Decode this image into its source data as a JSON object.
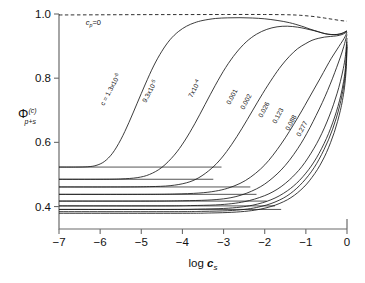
{
  "figure": {
    "background": "#ffffff",
    "axis_color": "#6b6b6b",
    "curve_color": "#1a1a1a"
  },
  "chart_data": {
    "type": "line",
    "title": "",
    "subtitle": "",
    "xlabel": "log c_s",
    "xlabel_parts": {
      "main": "log ",
      "var": "c",
      "sub": "s"
    },
    "ylabel": "Φ(c)p+s",
    "ylabel_parts": {
      "symbol": "Φ",
      "sup": "(c)",
      "sub": "p+s"
    },
    "xlim": [
      -7,
      0
    ],
    "ylim": [
      0.33,
      1.0
    ],
    "xticks": [
      -7,
      -6,
      -5,
      -4,
      -3,
      -2,
      -1,
      0
    ],
    "xticklabels": [
      "−7",
      "−6",
      "−5",
      "−4",
      "−3",
      "−2",
      "−1",
      "0"
    ],
    "yticks": [
      0.4,
      0.6,
      0.8,
      1.0
    ],
    "yticklabels": [
      "0.4",
      "0.6",
      "0.8",
      "1.0"
    ],
    "grid": false,
    "legend_position": "inline-curve-labels",
    "annotations": [
      {
        "name": "cp-zero",
        "text_parts": {
          "var": "c",
          "sub": "p",
          "rest": "=0"
        },
        "text": "c_p=0",
        "x": -6.35,
        "y": 0.965,
        "style": "upright"
      }
    ],
    "series": [
      {
        "name": "cp-zero-dashed",
        "label": "c_p=0",
        "style": "dashed",
        "points": [
          [
            -7,
            0.997
          ],
          [
            -6,
            0.9975
          ],
          [
            -5,
            0.998
          ],
          [
            -4,
            0.9982
          ],
          [
            -3,
            0.9984
          ],
          [
            -2.5,
            0.9985
          ],
          [
            -2,
            0.9984
          ],
          [
            -1.5,
            0.9978
          ],
          [
            -1.2,
            0.9965
          ],
          [
            -1.0,
            0.9945
          ],
          [
            -0.8,
            0.992
          ],
          [
            -0.6,
            0.9885
          ],
          [
            -0.45,
            0.9855
          ],
          [
            -0.3,
            0.9825
          ],
          [
            -0.15,
            0.9795
          ],
          [
            0,
            0.9775
          ]
        ]
      },
      {
        "name": "curve-1",
        "label": "cₛ = 1.3x10⁻⁶",
        "label_text": "c = 1.3x10",
        "label_exp": "-6",
        "label_rot": -62,
        "label_x": 104,
        "label_y": 106,
        "plateau": 0.523,
        "style": "solid",
        "points": [
          [
            -7,
            0.523
          ],
          [
            -6.6,
            0.523
          ],
          [
            -6.3,
            0.524
          ],
          [
            -6.1,
            0.528
          ],
          [
            -5.9,
            0.54
          ],
          [
            -5.7,
            0.566
          ],
          [
            -5.5,
            0.608
          ],
          [
            -5.3,
            0.662
          ],
          [
            -5.1,
            0.722
          ],
          [
            -4.9,
            0.782
          ],
          [
            -4.7,
            0.838
          ],
          [
            -4.5,
            0.884
          ],
          [
            -4.3,
            0.92
          ],
          [
            -4.1,
            0.945
          ],
          [
            -3.9,
            0.962
          ],
          [
            -3.7,
            0.973
          ],
          [
            -3.5,
            0.98
          ],
          [
            -3.2,
            0.986
          ],
          [
            -2.9,
            0.988
          ],
          [
            -2.6,
            0.9885
          ],
          [
            -2.3,
            0.9875
          ],
          [
            -2.0,
            0.985
          ],
          [
            -1.7,
            0.98
          ],
          [
            -1.4,
            0.973
          ],
          [
            -1.1,
            0.962
          ],
          [
            -0.9,
            0.953
          ],
          [
            -0.7,
            0.945
          ],
          [
            -0.55,
            0.939
          ],
          [
            -0.4,
            0.936
          ],
          [
            -0.25,
            0.936
          ],
          [
            -0.12,
            0.94
          ],
          [
            0,
            0.948
          ]
        ]
      },
      {
        "name": "curve-2",
        "label": "9.3x10⁻⁵",
        "label_text": "9.3x10",
        "label_exp": "-5",
        "label_rot": -62,
        "label_x": 146,
        "label_y": 103,
        "plateau": 0.485,
        "style": "solid",
        "points": [
          [
            -7,
            0.485
          ],
          [
            -6.0,
            0.485
          ],
          [
            -5.5,
            0.486
          ],
          [
            -5.1,
            0.49
          ],
          [
            -4.8,
            0.5
          ],
          [
            -4.5,
            0.522
          ],
          [
            -4.2,
            0.56
          ],
          [
            -3.95,
            0.604
          ],
          [
            -3.7,
            0.658
          ],
          [
            -3.45,
            0.718
          ],
          [
            -3.2,
            0.778
          ],
          [
            -2.95,
            0.833
          ],
          [
            -2.7,
            0.878
          ],
          [
            -2.45,
            0.913
          ],
          [
            -2.2,
            0.937
          ],
          [
            -1.95,
            0.952
          ],
          [
            -1.7,
            0.96
          ],
          [
            -1.45,
            0.962
          ],
          [
            -1.2,
            0.959
          ],
          [
            -1.0,
            0.954
          ],
          [
            -0.8,
            0.948
          ],
          [
            -0.6,
            0.941
          ],
          [
            -0.45,
            0.937
          ],
          [
            -0.3,
            0.936
          ],
          [
            -0.15,
            0.938
          ],
          [
            0,
            0.946
          ]
        ]
      },
      {
        "name": "curve-3",
        "label": "7x10⁻⁴",
        "label_text": "7x10",
        "label_exp": "-4",
        "label_rot": -62,
        "label_x": 192,
        "label_y": 98,
        "plateau": 0.461,
        "style": "solid",
        "points": [
          [
            -7,
            0.461
          ],
          [
            -5.5,
            0.461
          ],
          [
            -4.8,
            0.462
          ],
          [
            -4.3,
            0.465
          ],
          [
            -3.9,
            0.474
          ],
          [
            -3.6,
            0.49
          ],
          [
            -3.3,
            0.518
          ],
          [
            -3.05,
            0.551
          ],
          [
            -2.8,
            0.594
          ],
          [
            -2.55,
            0.644
          ],
          [
            -2.3,
            0.698
          ],
          [
            -2.05,
            0.752
          ],
          [
            -1.8,
            0.802
          ],
          [
            -1.6,
            0.838
          ],
          [
            -1.4,
            0.868
          ],
          [
            -1.2,
            0.892
          ],
          [
            -1.0,
            0.908
          ],
          [
            -0.85,
            0.918
          ],
          [
            -0.7,
            0.924
          ],
          [
            -0.55,
            0.928
          ],
          [
            -0.4,
            0.93
          ],
          [
            -0.25,
            0.932
          ],
          [
            -0.12,
            0.936
          ],
          [
            0,
            0.944
          ]
        ]
      },
      {
        "name": "curve-4",
        "label": "0.001",
        "label_rot": -62,
        "label_x": 230,
        "label_y": 105,
        "plateau": 0.438,
        "style": "solid",
        "points": [
          [
            -7,
            0.438
          ],
          [
            -5.0,
            0.438
          ],
          [
            -4.2,
            0.439
          ],
          [
            -3.6,
            0.442
          ],
          [
            -3.2,
            0.448
          ],
          [
            -2.9,
            0.457
          ],
          [
            -2.6,
            0.472
          ],
          [
            -2.35,
            0.491
          ],
          [
            -2.1,
            0.517
          ],
          [
            -1.9,
            0.544
          ],
          [
            -1.7,
            0.577
          ],
          [
            -1.5,
            0.614
          ],
          [
            -1.3,
            0.655
          ],
          [
            -1.1,
            0.698
          ],
          [
            -0.95,
            0.732
          ],
          [
            -0.8,
            0.766
          ],
          [
            -0.65,
            0.8
          ],
          [
            -0.5,
            0.835
          ],
          [
            -0.38,
            0.862
          ],
          [
            -0.25,
            0.888
          ],
          [
            -0.15,
            0.908
          ],
          [
            -0.07,
            0.924
          ],
          [
            0,
            0.942
          ]
        ]
      },
      {
        "name": "curve-5",
        "label": "0.002",
        "label_rot": -62,
        "label_x": 244,
        "label_y": 110,
        "plateau": 0.417,
        "style": "solid",
        "points": [
          [
            -7,
            0.417
          ],
          [
            -4.8,
            0.417
          ],
          [
            -4.0,
            0.418
          ],
          [
            -3.4,
            0.42
          ],
          [
            -3.0,
            0.424
          ],
          [
            -2.7,
            0.431
          ],
          [
            -2.45,
            0.441
          ],
          [
            -2.2,
            0.455
          ],
          [
            -2.0,
            0.47
          ],
          [
            -1.8,
            0.49
          ],
          [
            -1.6,
            0.514
          ],
          [
            -1.4,
            0.544
          ],
          [
            -1.2,
            0.58
          ],
          [
            -1.05,
            0.611
          ],
          [
            -0.9,
            0.646
          ],
          [
            -0.75,
            0.684
          ],
          [
            -0.6,
            0.724
          ],
          [
            -0.47,
            0.762
          ],
          [
            -0.35,
            0.8
          ],
          [
            -0.25,
            0.834
          ],
          [
            -0.16,
            0.866
          ],
          [
            -0.08,
            0.898
          ],
          [
            0,
            0.936
          ]
        ]
      },
      {
        "name": "curve-6",
        "label": "0.026",
        "label_rot": -62,
        "label_x": 262,
        "label_y": 118,
        "plateau": 0.402,
        "style": "solid",
        "points": [
          [
            -7,
            0.402
          ],
          [
            -4.5,
            0.402
          ],
          [
            -3.8,
            0.403
          ],
          [
            -3.2,
            0.405
          ],
          [
            -2.8,
            0.409
          ],
          [
            -2.5,
            0.415
          ],
          [
            -2.25,
            0.423
          ],
          [
            -2.0,
            0.434
          ],
          [
            -1.8,
            0.446
          ],
          [
            -1.6,
            0.462
          ],
          [
            -1.4,
            0.483
          ],
          [
            -1.25,
            0.502
          ],
          [
            -1.1,
            0.524
          ],
          [
            -0.95,
            0.551
          ],
          [
            -0.8,
            0.582
          ],
          [
            -0.68,
            0.61
          ],
          [
            -0.55,
            0.645
          ],
          [
            -0.43,
            0.682
          ],
          [
            -0.33,
            0.717
          ],
          [
            -0.24,
            0.753
          ],
          [
            -0.16,
            0.79
          ],
          [
            -0.09,
            0.83
          ],
          [
            -0.04,
            0.868
          ],
          [
            0,
            0.925
          ]
        ]
      },
      {
        "name": "curve-7",
        "label": "0.123",
        "label_rot": -62,
        "label_x": 276,
        "label_y": 124,
        "plateau": 0.391,
        "style": "solid",
        "points": [
          [
            -7,
            0.391
          ],
          [
            -4.3,
            0.391
          ],
          [
            -3.6,
            0.392
          ],
          [
            -3.0,
            0.394
          ],
          [
            -2.6,
            0.398
          ],
          [
            -2.3,
            0.404
          ],
          [
            -2.05,
            0.412
          ],
          [
            -1.85,
            0.421
          ],
          [
            -1.65,
            0.433
          ],
          [
            -1.45,
            0.449
          ],
          [
            -1.3,
            0.464
          ],
          [
            -1.15,
            0.482
          ],
          [
            -1.0,
            0.504
          ],
          [
            -0.87,
            0.526
          ],
          [
            -0.74,
            0.552
          ],
          [
            -0.62,
            0.58
          ],
          [
            -0.5,
            0.612
          ],
          [
            -0.4,
            0.643
          ],
          [
            -0.3,
            0.679
          ],
          [
            -0.22,
            0.712
          ],
          [
            -0.15,
            0.747
          ],
          [
            -0.09,
            0.785
          ],
          [
            -0.04,
            0.83
          ],
          [
            0,
            0.914
          ]
        ]
      },
      {
        "name": "curve-8",
        "label": "0.088",
        "label_rot": -62,
        "label_x": 289,
        "label_y": 131,
        "plateau": 0.384,
        "style": "solid",
        "points": [
          [
            -7,
            0.384
          ],
          [
            -4.2,
            0.384
          ],
          [
            -3.5,
            0.385
          ],
          [
            -2.9,
            0.387
          ],
          [
            -2.5,
            0.391
          ],
          [
            -2.2,
            0.397
          ],
          [
            -1.95,
            0.405
          ],
          [
            -1.75,
            0.414
          ],
          [
            -1.55,
            0.426
          ],
          [
            -1.38,
            0.44
          ],
          [
            -1.22,
            0.457
          ],
          [
            -1.08,
            0.475
          ],
          [
            -0.94,
            0.496
          ],
          [
            -0.8,
            0.521
          ],
          [
            -0.68,
            0.547
          ],
          [
            -0.56,
            0.577
          ],
          [
            -0.45,
            0.608
          ],
          [
            -0.35,
            0.641
          ],
          [
            -0.26,
            0.676
          ],
          [
            -0.18,
            0.713
          ],
          [
            -0.12,
            0.748
          ],
          [
            -0.06,
            0.793
          ],
          [
            -0.02,
            0.845
          ],
          [
            0,
            0.905
          ]
        ]
      },
      {
        "name": "curve-9",
        "label": "0.277",
        "label_rot": -62,
        "label_x": 300,
        "label_y": 137,
        "plateau": 0.379,
        "style": "solid",
        "points": [
          [
            -7,
            0.379
          ],
          [
            -4.0,
            0.379
          ],
          [
            -3.3,
            0.38
          ],
          [
            -2.8,
            0.382
          ],
          [
            -2.4,
            0.386
          ],
          [
            -2.1,
            0.392
          ],
          [
            -1.85,
            0.4
          ],
          [
            -1.65,
            0.409
          ],
          [
            -1.45,
            0.421
          ],
          [
            -1.28,
            0.435
          ],
          [
            -1.12,
            0.452
          ],
          [
            -0.98,
            0.47
          ],
          [
            -0.85,
            0.491
          ],
          [
            -0.72,
            0.515
          ],
          [
            -0.6,
            0.542
          ],
          [
            -0.5,
            0.568
          ],
          [
            -0.4,
            0.599
          ],
          [
            -0.31,
            0.631
          ],
          [
            -0.23,
            0.665
          ],
          [
            -0.16,
            0.7
          ],
          [
            -0.11,
            0.731
          ],
          [
            -0.06,
            0.772
          ],
          [
            -0.02,
            0.828
          ],
          [
            0,
            0.898
          ]
        ]
      }
    ],
    "plateau_lines": {
      "name": "left-plateau-levels",
      "x_from": -7,
      "x_to_values": [
        -3.05,
        -3.25,
        -2.35,
        -2.2,
        -1.95,
        -1.75,
        -1.6
      ],
      "levels": [
        0.523,
        0.485,
        0.461,
        0.438,
        0.417,
        0.402,
        0.391
      ]
    }
  }
}
